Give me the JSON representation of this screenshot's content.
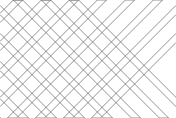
{
  "figure": {
    "type": "diagram",
    "width": 176,
    "height": 118,
    "background_color": "#ffffff",
    "stroke_color": "#6e6e6e",
    "stroke_width": 0.75
  },
  "pattern": {
    "band_width": 6.5,
    "slope_down_angle_deg": -45,
    "slope_up_angle_deg": 45,
    "band_count_down": 7,
    "band_count_up": 7,
    "band_spacing": 28,
    "cell_shape": "diamond"
  },
  "bands_down": [
    {
      "name": "down-band-1",
      "offset": -74
    },
    {
      "name": "down-band-2",
      "offset": -46
    },
    {
      "name": "down-band-3",
      "offset": -18
    },
    {
      "name": "down-band-4",
      "offset": 10
    },
    {
      "name": "down-band-5",
      "offset": 38
    },
    {
      "name": "down-band-6",
      "offset": 66
    },
    {
      "name": "down-band-7",
      "offset": 94
    },
    {
      "name": "down-band-8",
      "offset": 122
    },
    {
      "name": "down-band-9",
      "offset": 150
    }
  ],
  "bands_up": [
    {
      "name": "up-band-1",
      "offset": -10
    },
    {
      "name": "up-band-2",
      "offset": 18
    },
    {
      "name": "up-band-3",
      "offset": 46
    },
    {
      "name": "up-band-4",
      "offset": 74
    },
    {
      "name": "up-band-5",
      "offset": 102
    },
    {
      "name": "up-band-6",
      "offset": 130
    },
    {
      "name": "up-band-7",
      "offset": 158
    },
    {
      "name": "up-band-8",
      "offset": 186
    },
    {
      "name": "up-band-9",
      "offset": 214
    }
  ]
}
